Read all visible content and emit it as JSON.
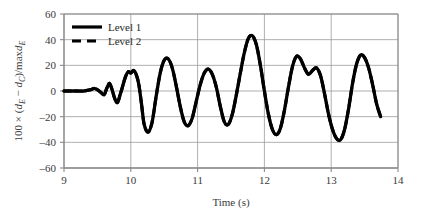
{
  "chart_data": {
    "type": "line",
    "title": "",
    "xlabel": "Time (s)",
    "ylabel": "100 × (d_E − d_C)/maxd_E",
    "ylabel_parts": {
      "prefix": "100 × (",
      "var1": "d",
      "sub1": "E",
      "minus": " − ",
      "var2": "d",
      "sub2": "C",
      "middle": ")/max",
      "var3": "d",
      "sub3": "E"
    },
    "xlim": [
      9,
      14
    ],
    "ylim": [
      -60,
      60
    ],
    "xticks": [
      9,
      10,
      11,
      12,
      13,
      14
    ],
    "yticks": [
      60,
      40,
      20,
      0,
      -20,
      -40,
      -60
    ],
    "xtick_labels": [
      "9",
      "10",
      "11",
      "12",
      "13",
      "14"
    ],
    "ytick_labels": [
      "60",
      "40",
      "20",
      "0",
      "–20",
      "–40",
      "–60"
    ],
    "grid": true,
    "grid_color": "#9a9a9a",
    "axis_color": "#8a8a8a",
    "legend": {
      "position": "top-left-inside",
      "entries": [
        {
          "label": "Level 1",
          "style": "solid",
          "color": "#000000",
          "width": 3.2
        },
        {
          "label": "Level 2",
          "style": "dashed",
          "color": "#000000",
          "width": 3.2
        }
      ]
    },
    "series": [
      {
        "name": "Level 1",
        "style": "solid",
        "color": "#000000",
        "x": [
          9.0,
          9.1,
          9.2,
          9.3,
          9.4,
          9.45,
          9.5,
          9.55,
          9.6,
          9.64,
          9.68,
          9.72,
          9.76,
          9.8,
          9.84,
          9.88,
          9.92,
          9.96,
          10.0,
          10.04,
          10.08,
          10.12,
          10.16,
          10.2,
          10.26,
          10.32,
          10.38,
          10.44,
          10.5,
          10.56,
          10.62,
          10.68,
          10.74,
          10.8,
          10.86,
          10.92,
          10.98,
          11.04,
          11.1,
          11.16,
          11.22,
          11.28,
          11.34,
          11.4,
          11.46,
          11.52,
          11.58,
          11.64,
          11.7,
          11.76,
          11.82,
          11.88,
          11.94,
          12.0,
          12.06,
          12.12,
          12.18,
          12.24,
          12.3,
          12.36,
          12.42,
          12.48,
          12.54,
          12.6,
          12.66,
          12.72,
          12.78,
          12.84,
          12.9,
          12.96,
          13.02,
          13.08,
          13.14,
          13.2,
          13.26,
          13.32,
          13.38,
          13.44,
          13.5,
          13.56,
          13.62,
          13.68,
          13.74
        ],
        "y": [
          0,
          0,
          0,
          0,
          1,
          2,
          1,
          -1,
          -3,
          2,
          6,
          1,
          -6,
          -9,
          -3,
          4,
          11,
          15,
          14,
          16,
          13,
          5,
          -10,
          -26,
          -32,
          -24,
          -4,
          14,
          24,
          25,
          18,
          4,
          -12,
          -24,
          -27,
          -21,
          -8,
          5,
          14,
          17,
          13,
          3,
          -12,
          -24,
          -26,
          -18,
          -3,
          14,
          30,
          41,
          43,
          36,
          20,
          0,
          -18,
          -30,
          -34,
          -29,
          -15,
          3,
          19,
          27,
          25,
          18,
          13,
          16,
          18,
          12,
          -2,
          -18,
          -30,
          -37,
          -38,
          -30,
          -14,
          6,
          21,
          28,
          26,
          18,
          5,
          -10,
          -20
        ]
      },
      {
        "name": "Level 2",
        "style": "dashed",
        "color": "#000000",
        "x": [
          9.0,
          9.1,
          9.2,
          9.3,
          9.4,
          9.45,
          9.5,
          9.55,
          9.6,
          9.64,
          9.68,
          9.72,
          9.76,
          9.8,
          9.84,
          9.88,
          9.92,
          9.96,
          10.0,
          10.04,
          10.08,
          10.12,
          10.16,
          10.2,
          10.26,
          10.32,
          10.38,
          10.44,
          10.5,
          10.56,
          10.62,
          10.68,
          10.74,
          10.8,
          10.86,
          10.92,
          10.98,
          11.04,
          11.1,
          11.16,
          11.22,
          11.28,
          11.34,
          11.4,
          11.46,
          11.52,
          11.58,
          11.64,
          11.7,
          11.76,
          11.82,
          11.88,
          11.94,
          12.0,
          12.06,
          12.12,
          12.18,
          12.24,
          12.3,
          12.36,
          12.42,
          12.48,
          12.54,
          12.6,
          12.66,
          12.72,
          12.78,
          12.84,
          12.9,
          12.96,
          13.02,
          13.08,
          13.14,
          13.2,
          13.26,
          13.32,
          13.38,
          13.44,
          13.5,
          13.56,
          13.62,
          13.68,
          13.74
        ],
        "y": [
          0,
          0,
          0,
          0,
          1,
          2,
          1,
          -1,
          -3,
          2,
          6,
          1,
          -6,
          -9,
          -3,
          4,
          11,
          15,
          14,
          16,
          13,
          5,
          -10,
          -26,
          -32,
          -24,
          -4,
          14,
          24,
          25,
          18,
          4,
          -12,
          -24,
          -27,
          -21,
          -8,
          5,
          14,
          17,
          13,
          3,
          -12,
          -24,
          -26,
          -18,
          -3,
          14,
          30,
          41,
          43,
          36,
          20,
          0,
          -18,
          -30,
          -34,
          -29,
          -15,
          3,
          19,
          27,
          25,
          18,
          13,
          16,
          18,
          12,
          -2,
          -18,
          -30,
          -37,
          -38,
          -30,
          -14,
          6,
          21,
          28,
          26,
          18,
          5,
          -10,
          -20
        ]
      }
    ]
  }
}
